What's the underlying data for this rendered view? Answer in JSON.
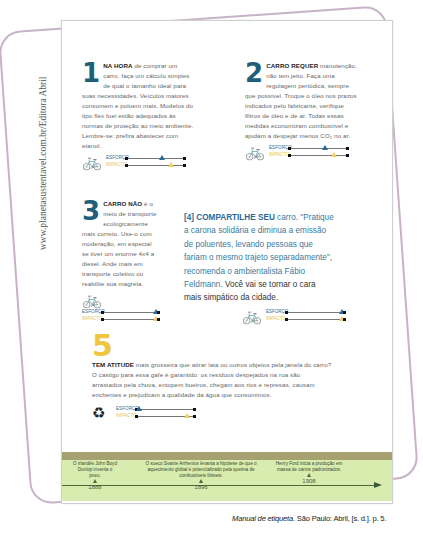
{
  "side_credit": "www.planetasustentavel.com.br/Editora Abril",
  "tips": [
    {
      "number": "1",
      "lead": "NA HORA",
      "text": " de comprar um carro, faça um cálculo simples de qual o tamanho ideal para suas necessidades. Veículos maiores consomem e poluem mais. Modelos do tipo flex fuel estão adequados às normas de proteção ao meio ambiente. Lembre-se: prefira abastecer com etanol.",
      "icon": "bicycle-icon",
      "meter": {
        "effort_label": "ESFORÇO",
        "impact_label": "IMPACTO",
        "effort_pos": 55,
        "impact_pos": 70
      }
    },
    {
      "number": "2",
      "lead": "CARRO REQUER",
      "text": " manutenção, não tem jeito. Faça uma regulagem periódica, sempre que possível. Troque o óleo nos prazos indicados pelo fabricante, verifique filtros de óleo e de ar. Todas essas medidas economizam combustível e ajudam a despejar menos CO₂ no ar.",
      "icon": "bicycle-icon",
      "meter": {
        "effort_label": "ESFORÇO",
        "impact_label": "IMPACTO",
        "effort_pos": 55,
        "impact_pos": 70
      }
    },
    {
      "number": "3",
      "lead": "CARRO NÃO",
      "text": " é o meio de transporte ecologicamente mais correto. Use-o com moderação, em especial se tiver um enorme 4x4 a diesel. Ande mais em transporte coletivo ou reabilite sua magrela.",
      "icon": "bicycle-icon",
      "meter": {
        "effort_label": "ESFORÇO",
        "impact_label": "IMPACTO",
        "effort_pos": 88,
        "impact_pos": 88
      }
    },
    {
      "number": "[4]",
      "lead": "COMPARTILHE SEU",
      "text": " carro. \"Pratique a carona solidária e diminua a emissão de poluentes, levando pessoas que fariam o mesmo trajeto separadamente\", recomenda o ambientalista Fábio Feldmann. ",
      "text_dark": "Você vai se tornar o cara mais simpático da cidade.",
      "icon": "bicycle-icon",
      "meter": {
        "effort_label": "ESFORÇO",
        "impact_label": "IMPACTO",
        "effort_pos": 88,
        "impact_pos": 88
      }
    },
    {
      "number": "5",
      "lead": "TEM ATITUDE",
      "text": " mais grosseira que atirar lata ou outros objetos pela janela do carro? O castigo para essa gafe é garantido: os resíduos despejados na rua são arrastados pela chuva, entopem bueiros, chegam aos rios e represas, causam enchentes e prejudicam a qualidade da água que consumimos.",
      "icon": "recycle-icon",
      "meter": {
        "effort_label": "ESFORÇO",
        "impact_label": "IMPACTO",
        "effort_pos": 2,
        "impact_pos": 80
      }
    }
  ],
  "timeline": {
    "events": [
      {
        "text": "O irlandês John Boyd Dunlop inventa o pneu.",
        "year": "1888"
      },
      {
        "text": "O sueco Svante Arrhenius levanta a hipótese de que o aquecimento global é potencializado pela queima de combustíveis fósseis.",
        "year": "1896"
      },
      {
        "text": "Henry Ford inicia a produção em massa de carros padronizados.",
        "year": "1908"
      }
    ]
  },
  "citation": {
    "title": "Manual de etiqueta",
    "rest": ". São Paulo: Abril, [s. d.]. p. 5."
  },
  "colors": {
    "blue": "#1f5f7a",
    "yellow": "#f0c640",
    "timeline_bg": "#d7ecae",
    "timeline_band": "#a7a071",
    "frame": "#c8b2c8"
  }
}
